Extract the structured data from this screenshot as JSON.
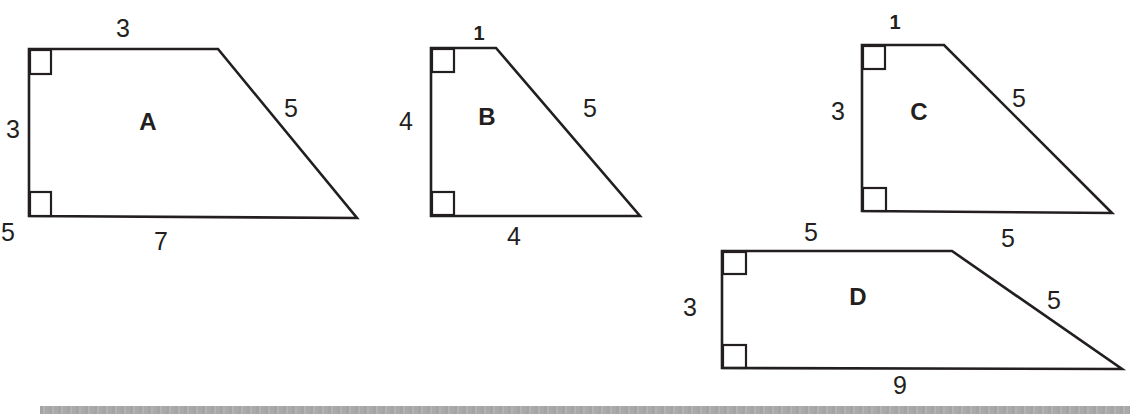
{
  "figure": {
    "colors": {
      "stroke": "#231f20",
      "background": "#ffffff",
      "footer_bar": "#a9a9a9"
    },
    "shapes": [
      {
        "name": "A",
        "sides": {
          "top": "3",
          "left": "3",
          "slant": "5",
          "bottom": "7"
        },
        "right_angles": 2
      },
      {
        "name": "B",
        "sides": {
          "top": "1",
          "left": "4",
          "slant": "5",
          "bottom": "4"
        },
        "right_angles": 2
      },
      {
        "name": "C",
        "sides": {
          "top": "1",
          "left": "3",
          "slant": "5",
          "bottom": "5"
        },
        "right_angles": 2
      },
      {
        "name": "D",
        "sides": {
          "top": "5",
          "left": "3",
          "slant": "5",
          "bottom": "9",
          "extra_label": "5"
        },
        "right_angles": 2
      }
    ]
  }
}
